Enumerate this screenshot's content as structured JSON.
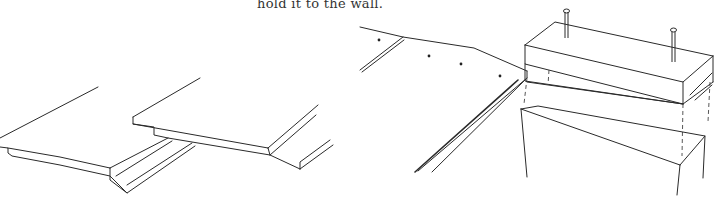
{
  "caption": "hold it to the wall.",
  "figures": [
    {
      "name": "tongue-and-groove-boards",
      "description": "Two overlapping tongue-and-groove boards"
    },
    {
      "name": "board-nailed-to-wall-block",
      "description": "Board edge with nail holes next to a block with two nails above a wall stud"
    }
  ]
}
